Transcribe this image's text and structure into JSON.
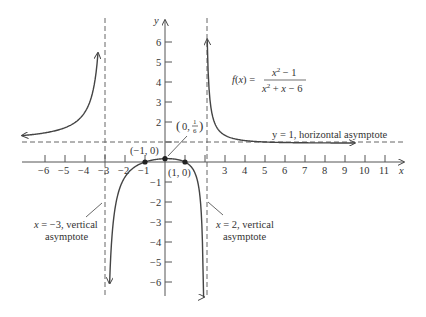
{
  "chart_data": {
    "type": "line",
    "title": "",
    "function_label": "f(x) = (x^2 - 1) / (x^2 + x - 6)",
    "function_parts": {
      "lhs": "f(x) =",
      "numerator": "x² − 1",
      "denominator": "x² + x − 6"
    },
    "xlabel": "x",
    "ylabel": "y",
    "xlim": [
      -7,
      12
    ],
    "ylim": [
      -6.8,
      7
    ],
    "grid": false,
    "x_ticks": [
      -6,
      -5,
      -4,
      -3,
      -2,
      -1,
      1,
      2,
      3,
      4,
      5,
      6,
      7,
      8,
      9,
      10,
      11
    ],
    "x_tick_labels": [
      "−6",
      "−5",
      "−4",
      "−3",
      "−2",
      "−1",
      "3",
      "4",
      "5",
      "6",
      "7",
      "8",
      "9",
      "10",
      "11"
    ],
    "y_ticks": [
      -6,
      -5,
      -4,
      -3,
      -2,
      -1,
      1,
      2,
      3,
      4,
      5,
      6
    ],
    "y_tick_labels": [
      "6",
      "5",
      "4",
      "3",
      "2",
      "−1",
      "−2",
      "−3",
      "−4",
      "−5",
      "−6"
    ],
    "asymptotes": {
      "vertical": [
        {
          "x": -3,
          "label": "x = −3, vertical asymptote"
        },
        {
          "x": 2,
          "label": "x = 2, vertical asymptote"
        }
      ],
      "horizontal": [
        {
          "y": 1,
          "label": "y = 1, horizontal asymptote"
        }
      ]
    },
    "points": [
      {
        "x": -1,
        "y": 0,
        "label": "(−1, 0)"
      },
      {
        "x": 0,
        "y": 0.1667,
        "label": "(0, 1/6)"
      },
      {
        "x": 1,
        "y": 0,
        "label": "(1, 0)"
      }
    ],
    "series": [
      {
        "name": "left branch (x < −3)",
        "x_range": [
          -7,
          -3.1
        ]
      },
      {
        "name": "middle branch (−3 < x < 2)",
        "x_range": [
          -2.85,
          1.92
        ]
      },
      {
        "name": "right branch (x > 2)",
        "x_range": [
          2.07,
          9.5
        ]
      }
    ]
  },
  "labels": {
    "x_axis": "x",
    "y_axis": "y",
    "func_lhs": "f(x) =",
    "func_num": "x",
    "func_den_a": "x",
    "func_num_rest": " − 1",
    "func_den_rest": " + x − 6",
    "sup2": "2",
    "horiz_asym": "y = 1, horizontal asymptote",
    "vert_asym_left_1a": "x",
    "vert_asym_left_1b": " = −3, vertical",
    "vert_asym_left_2": "asymptote",
    "vert_asym_right_1a": "x",
    "vert_asym_right_1b": " = 2, vertical",
    "vert_asym_right_2": "asymptote",
    "pt_neg1": "(−1, 0)",
    "pt_pos1": "(1, 0)",
    "pt_zero_open": "(0, ",
    "pt_zero_num": "1",
    "pt_zero_den": "6",
    "pt_zero_close": ")"
  },
  "colors": {
    "curve": "#444444",
    "axis": "#555555",
    "dashed": "#666666",
    "text": "#333333"
  }
}
